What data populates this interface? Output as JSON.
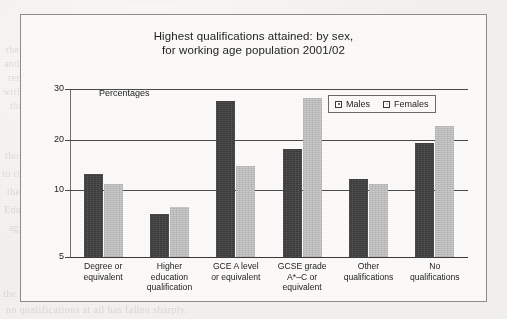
{
  "chart_data": {
    "type": "bar",
    "title": "Highest qualifications attained: by sex, for working age population 2001/02",
    "title_line1": "Highest qualifications attained: by sex,",
    "title_line2": "for working age population 2001/02",
    "ylabel": "Percentages",
    "xlabel": "",
    "ylim": [
      5,
      30
    ],
    "yticks": [
      5,
      10,
      20,
      30
    ],
    "ytick_labels": [
      "5",
      "10",
      "20",
      "30"
    ],
    "grid": true,
    "legend_position": "top-right-inside",
    "categories": [
      "Degree or equivalent",
      "Higher education qualification",
      "GCE A level or equivalent",
      "GCSE grade A*-C or equivalent",
      "Other qualifications",
      "No qualifications"
    ],
    "category_lines": [
      [
        "Degree or",
        "equivalent"
      ],
      [
        "Higher",
        "education",
        "qualification"
      ],
      [
        "GCE A level",
        "or equivalent"
      ],
      [
        "GCSE grade",
        "A*–C or",
        "equivalent"
      ],
      [
        "Other",
        "qualifications"
      ],
      [
        "No",
        "qualifications"
      ]
    ],
    "series": [
      {
        "name": "Males",
        "color": "#3b3b3b",
        "values": [
          13.2,
          8.2,
          27.6,
          18.2,
          12.2,
          19.5
        ]
      },
      {
        "name": "Females",
        "color": "#c9c9c9",
        "values": [
          11.3,
          8.7,
          14.9,
          28.3,
          11.2,
          22.7
        ]
      }
    ]
  },
  "legend": {
    "items": [
      {
        "label": "Males"
      },
      {
        "label": "Females"
      }
    ]
  },
  "background_text": {
    "lines": [
      "the reason why so many more men than women",
      "and this is reflected in their qualifications,",
      "remain in employment for much longer periods",
      "with women more likely to have no qualifications",
      "than men. Meanwhile the proportion of",
      "those with degree level attainment continues",
      "to rise steadily across both sexes, although",
      "the gap has narrowed in recent years.",
      "Educational attainment among the working",
      "age population has improved markedly since",
      "the early 1990s, and the proportion holding",
      "no qualifications at all has fallen sharply."
    ]
  }
}
